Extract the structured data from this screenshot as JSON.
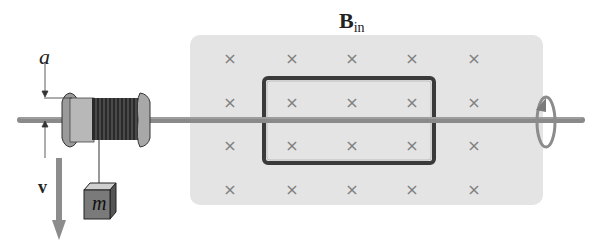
{
  "diagram": {
    "labels": {
      "radius": "a",
      "velocity": "v",
      "field_main": "B",
      "field_sub": "in",
      "mass": "m"
    },
    "field": {
      "direction": "into-page",
      "marker_symbol": "×",
      "rows": 4,
      "cols": 5,
      "region_color": "#e4e4e4",
      "marker_color": "#808080"
    },
    "colors": {
      "axle": "#8a8a8a",
      "loop": "#3a3a3a",
      "spool": "#9a9a9a",
      "coil": "#2a2a2a",
      "mass_block": "#7a7a7a",
      "arrow": "#8c8c8c"
    }
  }
}
